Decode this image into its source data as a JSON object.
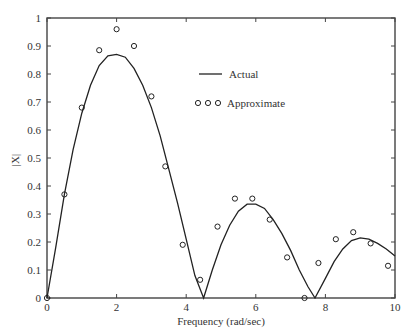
{
  "chart_data": {
    "type": "line",
    "title": "",
    "xlabel": "Frequency (rad/sec)",
    "ylabel": "|X|",
    "xlim": [
      0,
      10
    ],
    "ylim": [
      0,
      1
    ],
    "xticks": [
      0,
      2,
      4,
      6,
      8,
      10
    ],
    "yticks": [
      0,
      0.1,
      0.2,
      0.3,
      0.4,
      0.5,
      0.6,
      0.7,
      0.8,
      0.9,
      1
    ],
    "ytick_labels": [
      "0",
      "0.1",
      "0.2",
      "0.3",
      "0.4",
      "0.5",
      "0.6",
      "0.7",
      "0.8",
      "0.9",
      "1"
    ],
    "grid": false,
    "legend_position": "upper-center",
    "series": [
      {
        "name": "Actual",
        "style": "line",
        "x": [
          0,
          0.25,
          0.5,
          0.75,
          1.0,
          1.25,
          1.5,
          1.75,
          2.0,
          2.25,
          2.5,
          2.75,
          3.0,
          3.25,
          3.5,
          3.75,
          4.0,
          4.25,
          4.5,
          4.75,
          5.0,
          5.25,
          5.5,
          5.75,
          6.0,
          6.25,
          6.5,
          6.75,
          7.0,
          7.25,
          7.5,
          7.7,
          8.0,
          8.25,
          8.5,
          8.75,
          9.0,
          9.25,
          9.5,
          9.75,
          10.0
        ],
        "values": [
          0.0,
          0.18,
          0.37,
          0.53,
          0.66,
          0.76,
          0.83,
          0.865,
          0.87,
          0.86,
          0.82,
          0.76,
          0.68,
          0.58,
          0.46,
          0.34,
          0.21,
          0.08,
          0.0,
          0.1,
          0.19,
          0.26,
          0.31,
          0.335,
          0.335,
          0.32,
          0.28,
          0.23,
          0.17,
          0.1,
          0.04,
          0.0,
          0.07,
          0.13,
          0.175,
          0.205,
          0.215,
          0.21,
          0.195,
          0.175,
          0.15
        ]
      },
      {
        "name": "Approximate",
        "style": "markers",
        "x": [
          0,
          0.5,
          1.0,
          1.5,
          2.0,
          2.5,
          3.0,
          3.4,
          3.9,
          4.4,
          4.9,
          5.4,
          5.9,
          6.4,
          6.9,
          7.4,
          7.8,
          8.3,
          8.8,
          9.3,
          9.8
        ],
        "values": [
          0.0,
          0.37,
          0.68,
          0.885,
          0.96,
          0.9,
          0.72,
          0.47,
          0.19,
          0.065,
          0.255,
          0.355,
          0.355,
          0.28,
          0.145,
          0.0,
          0.125,
          0.21,
          0.235,
          0.195,
          0.115
        ]
      }
    ],
    "legend": [
      {
        "label": "Actual",
        "marker": "line"
      },
      {
        "label": "Approximate",
        "marker": "o o o"
      }
    ],
    "colors": {
      "line": "#222222",
      "axes": "#444444",
      "text": "#333333"
    }
  }
}
